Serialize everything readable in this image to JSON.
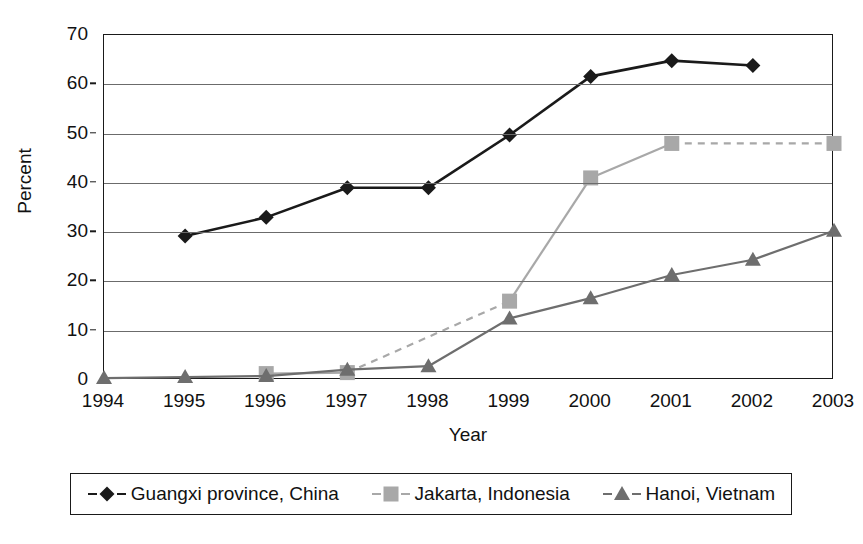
{
  "chart_data": {
    "type": "line",
    "title": "",
    "xlabel": "Year",
    "ylabel": "Percent",
    "categories": [
      "1994",
      "1995",
      "1996",
      "1997",
      "1998",
      "1999",
      "2000",
      "2001",
      "2002",
      "2003"
    ],
    "x": [
      1994,
      1995,
      1996,
      1997,
      1998,
      1999,
      2000,
      2001,
      2002,
      2003
    ],
    "xlim": [
      1994,
      2003
    ],
    "ylim": [
      0,
      70
    ],
    "y_ticks": [
      0,
      10,
      20,
      30,
      40,
      50,
      60,
      70
    ],
    "y_tick_labels": [
      "0",
      "10",
      "20",
      "30",
      "40",
      "50",
      "60",
      "70"
    ],
    "grid": "horizontal",
    "legend_position": "bottom",
    "series": [
      {
        "name": "Guangxi province, China",
        "marker": "diamond",
        "color": "#1a1a1a",
        "line_color": "#1a1a1a",
        "values": [
          null,
          29.2,
          33.0,
          39.0,
          39.0,
          49.7,
          61.6,
          64.8,
          63.8,
          null
        ]
      },
      {
        "name": "Jakarta, Indonesia",
        "marker": "square",
        "color": "#a8a8a8",
        "line_color": "#a8a8a8",
        "values": [
          null,
          null,
          1.3,
          1.5,
          null,
          16.0,
          41.0,
          48.0,
          null,
          48.0
        ],
        "dashed_segments": [
          [
            1997,
            1999
          ],
          [
            2001,
            2003
          ]
        ]
      },
      {
        "name": "Hanoi, Vietnam",
        "marker": "triangle",
        "color": "#6e6e6e",
        "line_color": "#6e6e6e",
        "values": [
          0.4,
          0.6,
          0.8,
          2.1,
          2.8,
          12.5,
          16.6,
          21.3,
          24.4,
          30.3
        ]
      }
    ]
  },
  "axes": {
    "y_title": "Percent",
    "x_title": "Year"
  },
  "legend": {
    "entries": [
      {
        "label": "Guangxi province, China",
        "marker": "diamond",
        "color": "#1a1a1a"
      },
      {
        "label": "Jakarta, Indonesia",
        "marker": "square",
        "color": "#a8a8a8"
      },
      {
        "label": "Hanoi, Vietnam",
        "marker": "triangle",
        "color": "#6e6e6e"
      }
    ]
  },
  "colors": {
    "guangxi": "#1a1a1a",
    "jakarta": "#a8a8a8",
    "hanoi": "#6e6e6e",
    "axis": "#1a1a1a",
    "grid": "#6b6b6b",
    "background": "#ffffff"
  }
}
